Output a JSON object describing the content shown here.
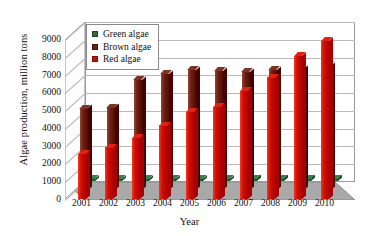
{
  "chart_data": {
    "type": "bar",
    "title": "",
    "subtitle": "",
    "xlabel": "Year",
    "ylabel": "Algae production, million tons",
    "categories": [
      "2001",
      "2002",
      "2003",
      "2004",
      "2005",
      "2006",
      "2007",
      "2008",
      "2009",
      "2010"
    ],
    "ylim": [
      0,
      9000
    ],
    "ytick_step": 1000,
    "yticks": [
      "9000",
      "8000",
      "7000",
      "6000",
      "5000",
      "4000",
      "3000",
      "2000",
      "1000",
      "0"
    ],
    "grid": true,
    "legend_position": "top-left",
    "three_d": true,
    "series": [
      {
        "name": "Green algae",
        "color": "#2d6b3f",
        "values": [
          120,
          120,
          130,
          130,
          140,
          140,
          150,
          150,
          160,
          160
        ]
      },
      {
        "name": "Brown algae",
        "color": "#6b2010",
        "values": [
          4600,
          4650,
          6200,
          6550,
          6750,
          6700,
          6650,
          6750,
          6800,
          7000
        ]
      },
      {
        "name": "Red algae",
        "color": "#cc1100",
        "values": [
          2550,
          2900,
          3450,
          4150,
          4900,
          5200,
          6100,
          6850,
          8050,
          8900
        ]
      }
    ]
  },
  "legend": {
    "entries": [
      {
        "label": "Green algae",
        "color": "#2d6b3f"
      },
      {
        "label": "Brown algae",
        "color": "#6b2010"
      },
      {
        "label": "Red algae",
        "color": "#cc1100"
      }
    ]
  }
}
